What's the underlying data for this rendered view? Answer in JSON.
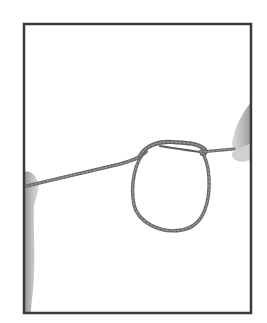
{
  "image": {
    "subject": "rope knot with loop held between two hands",
    "background_color": "#ffffff",
    "frame_color": "#3a3a3a",
    "rope_color": "#6e6e6e",
    "skin_color": "#b8b8b8"
  }
}
